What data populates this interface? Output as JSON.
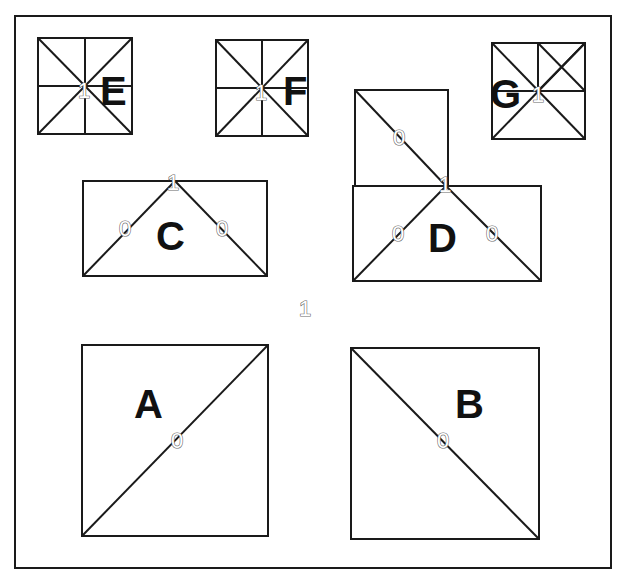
{
  "diagram": {
    "frame": {
      "x": 15,
      "y": 16,
      "w": 596,
      "h": 552
    },
    "center_label": {
      "text": "1",
      "x": 305,
      "y": 316
    },
    "panels": [
      {
        "id": "E",
        "label": "E",
        "label_pos": [
          100,
          105
        ],
        "box": [
          38,
          38,
          94,
          96
        ],
        "lines": [
          [
            38,
            38,
            132,
            134
          ],
          [
            132,
            38,
            38,
            134
          ],
          [
            85,
            38,
            85,
            134
          ],
          [
            38,
            86,
            132,
            86
          ]
        ],
        "values": [
          {
            "text": "1",
            "x": 84,
            "y": 98
          }
        ]
      },
      {
        "id": "F",
        "label": "F",
        "label_pos": [
          283,
          105
        ],
        "box": [
          216,
          40,
          92,
          96
        ],
        "lines": [
          [
            216,
            40,
            308,
            136
          ],
          [
            308,
            40,
            216,
            136
          ],
          [
            262,
            40,
            262,
            136
          ],
          [
            216,
            88,
            308,
            88
          ]
        ],
        "values": [
          {
            "text": "1",
            "x": 261,
            "y": 100
          }
        ]
      },
      {
        "id": "G",
        "label": "G",
        "label_pos": [
          490,
          108
        ],
        "box": [
          492,
          43,
          93,
          96
        ],
        "lines": [
          [
            492,
            43,
            585,
            139
          ],
          [
            585,
            43,
            492,
            139
          ],
          [
            538,
            43,
            538,
            91
          ],
          [
            492,
            91,
            585,
            91
          ],
          [
            538,
            43,
            585,
            91
          ],
          [
            585,
            43,
            538,
            91
          ]
        ],
        "values": [
          {
            "text": "1",
            "x": 538,
            "y": 102
          }
        ]
      },
      {
        "id": "C",
        "label": "C",
        "label_pos": [
          156,
          250
        ],
        "box": [
          83,
          181,
          184,
          95
        ],
        "lines": [
          [
            83,
            276,
            175,
            181
          ],
          [
            175,
            181,
            267,
            276
          ]
        ],
        "values": [
          {
            "text": "1",
            "x": 173,
            "y": 190
          },
          {
            "text": "0",
            "x": 125,
            "y": 236
          },
          {
            "text": "0",
            "x": 222,
            "y": 236
          }
        ]
      },
      {
        "id": "D",
        "label": "D",
        "label_pos": [
          428,
          252
        ],
        "box": [
          353,
          186,
          188,
          95
        ],
        "extra_box": [
          355,
          90,
          93,
          96
        ],
        "lines": [
          [
            355,
            90,
            446,
            186
          ],
          [
            353,
            281,
            446,
            186
          ],
          [
            446,
            186,
            541,
            281
          ]
        ],
        "values": [
          {
            "text": "0",
            "x": 399,
            "y": 145
          },
          {
            "text": "1",
            "x": 445,
            "y": 192
          },
          {
            "text": "0",
            "x": 398,
            "y": 241
          },
          {
            "text": "0",
            "x": 492,
            "y": 241
          }
        ]
      },
      {
        "id": "A",
        "label": "A",
        "label_pos": [
          134,
          418
        ],
        "box": [
          82,
          345,
          186,
          191
        ],
        "lines": [
          [
            82,
            536,
            268,
            345
          ]
        ],
        "values": [
          {
            "text": "0",
            "x": 177,
            "y": 448
          }
        ]
      },
      {
        "id": "B",
        "label": "B",
        "label_pos": [
          455,
          418
        ],
        "box": [
          351,
          348,
          188,
          191
        ],
        "lines": [
          [
            351,
            348,
            539,
            539
          ]
        ],
        "values": [
          {
            "text": "0",
            "x": 443,
            "y": 448
          }
        ]
      }
    ]
  }
}
